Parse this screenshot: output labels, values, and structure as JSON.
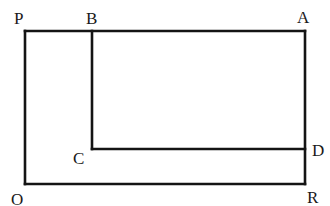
{
  "diagram": {
    "type": "geometry-figure",
    "colors": {
      "line": "#141414",
      "label": "#1a1a1a",
      "background": "#ffffff"
    },
    "points": [
      {
        "id": "P",
        "label": "P",
        "x": 25,
        "y": 31,
        "label_x": 14,
        "label_y": 24
      },
      {
        "id": "B",
        "label": "B",
        "x": 92,
        "y": 31,
        "label_x": 86,
        "label_y": 24
      },
      {
        "id": "A",
        "label": "A",
        "x": 305,
        "y": 31,
        "label_x": 297,
        "label_y": 23
      },
      {
        "id": "C",
        "label": "C",
        "x": 92,
        "y": 149,
        "label_x": 73,
        "label_y": 164
      },
      {
        "id": "D",
        "label": "D",
        "x": 305,
        "y": 149,
        "label_x": 312,
        "label_y": 156
      },
      {
        "id": "O",
        "label": "O",
        "x": 25,
        "y": 184,
        "label_x": 11,
        "label_y": 205
      },
      {
        "id": "R",
        "label": "R",
        "x": 305,
        "y": 184,
        "label_x": 307,
        "label_y": 203
      }
    ],
    "segments": [
      {
        "from": "P",
        "to": "A"
      },
      {
        "from": "A",
        "to": "R"
      },
      {
        "from": "R",
        "to": "O"
      },
      {
        "from": "O",
        "to": "P"
      },
      {
        "from": "B",
        "to": "C"
      },
      {
        "from": "C",
        "to": "D"
      }
    ]
  }
}
